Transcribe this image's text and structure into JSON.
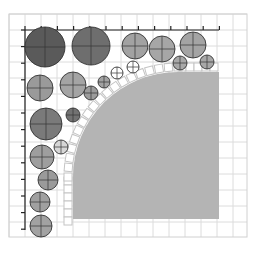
{
  "diagram": {
    "type": "circle-packing-layout",
    "colors": {
      "background": "#ffffff",
      "grid_line": "#dcdcdc",
      "grid_border": "#d0d0d0",
      "ruler": "#222222",
      "shape_fill": "#b4b4b4",
      "arc_tile_fill": "#ffffff",
      "arc_tile_stroke": "#c4c4c4",
      "circle_stroke": "#333333",
      "crosshair": "#333333"
    },
    "grid": {
      "x0": 9,
      "y0": 14,
      "x1": 247,
      "y1": 237,
      "step": 16
    },
    "rulers": {
      "top": {
        "y": 30,
        "x_start": 25,
        "x_end": 219,
        "tick_step": 16.2,
        "tick_len": 4
      },
      "left": {
        "x": 25,
        "y_start": 30,
        "y_end": 230,
        "tick_step": 16.6,
        "tick_len": 4
      }
    },
    "main_shape": {
      "x": 73,
      "y": 72,
      "right": 219,
      "bottom": 219,
      "corner_radius": 105
    },
    "circles": [
      {
        "cx": 45,
        "cy": 47,
        "r": 20,
        "fill": "#5a5a5a",
        "cross": true
      },
      {
        "cx": 91,
        "cy": 46,
        "r": 19,
        "fill": "#6e6e6e",
        "cross": true
      },
      {
        "cx": 135,
        "cy": 46,
        "r": 13,
        "fill": "#a2a2a2",
        "cross": true
      },
      {
        "cx": 162,
        "cy": 49,
        "r": 13,
        "fill": "#a6a6a6",
        "cross": true
      },
      {
        "cx": 193,
        "cy": 45,
        "r": 13,
        "fill": "#a4a4a4",
        "cross": true
      },
      {
        "cx": 180,
        "cy": 63,
        "r": 7,
        "fill": "#a8a8a8",
        "cross": true
      },
      {
        "cx": 207,
        "cy": 62,
        "r": 7,
        "fill": "#a8a8a8",
        "cross": true
      },
      {
        "cx": 133,
        "cy": 67,
        "r": 6,
        "fill": "#ffffff",
        "cross": true
      },
      {
        "cx": 117,
        "cy": 73,
        "r": 6,
        "fill": "#ffffff",
        "cross": true
      },
      {
        "cx": 40,
        "cy": 88,
        "r": 13,
        "fill": "#9a9a9a",
        "cross": true
      },
      {
        "cx": 73,
        "cy": 85,
        "r": 13,
        "fill": "#a4a4a4",
        "cross": true
      },
      {
        "cx": 91,
        "cy": 93,
        "r": 7,
        "fill": "#9c9c9c",
        "cross": true
      },
      {
        "cx": 104,
        "cy": 82,
        "r": 6,
        "fill": "#a2a2a2",
        "cross": true
      },
      {
        "cx": 46,
        "cy": 124,
        "r": 16,
        "fill": "#7a7a7a",
        "cross": true
      },
      {
        "cx": 73,
        "cy": 115,
        "r": 7,
        "fill": "#727272",
        "cross": true
      },
      {
        "cx": 61,
        "cy": 147,
        "r": 7,
        "fill": "#d6d6d6",
        "cross": true
      },
      {
        "cx": 42,
        "cy": 157,
        "r": 12,
        "fill": "#9e9e9e",
        "cross": true
      },
      {
        "cx": 48,
        "cy": 180,
        "r": 10,
        "fill": "#9a9a9a",
        "cross": true
      },
      {
        "cx": 40,
        "cy": 202,
        "r": 10,
        "fill": "#a0a0a0",
        "cross": true
      },
      {
        "cx": 41,
        "cy": 226,
        "r": 11,
        "fill": "#a2a2a2",
        "cross": true
      }
    ]
  }
}
